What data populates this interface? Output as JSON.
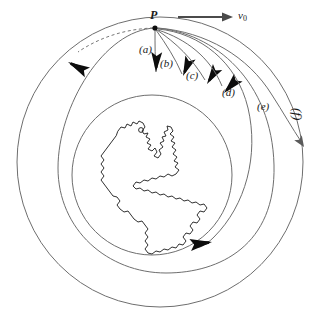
{
  "figure": {
    "background_color": "#ffffff",
    "stroke_color": "#555555",
    "dark_stroke_color": "#111111",
    "earth_stroke_color": "#6b6b6b",
    "continent_stroke_color": "#1a1a1a"
  },
  "launch_point": {
    "label": "P",
    "x": 155,
    "y": 28,
    "dot_radius": 2.6
  },
  "velocity_vector": {
    "label_v": "v",
    "label_sub": "0",
    "label_full": "v0",
    "arrow_from_x": 178,
    "arrow_to_x": 232,
    "arrow_y": 17,
    "label_x": 238,
    "label_y": 11
  },
  "trajectories": [
    {
      "id": "a",
      "label": "(a)",
      "label_x": 141,
      "label_y": 45,
      "impact_description": "steep near-vertical fall just past launch point",
      "arrowhead_angle_deg": 95
    },
    {
      "id": "b",
      "label": "(b)",
      "label_x": 160,
      "label_y": 58,
      "impact_description": "falls to surface a short distance downrange",
      "arrowhead_angle_deg": 110
    },
    {
      "id": "c",
      "label": "(c)",
      "label_x": 185,
      "label_y": 70,
      "impact_description": "falls to surface farther downrange",
      "arrowhead_angle_deg": 125
    },
    {
      "id": "d",
      "label": "(d)",
      "label_x": 223,
      "label_y": 88,
      "impact_description": "grazes further around the globe before impact",
      "arrowhead_angle_deg": 140
    },
    {
      "id": "e",
      "label": "(e)",
      "label_x": 258,
      "label_y": 103,
      "impact_description": "closed elliptical orbit returning to P",
      "arrowhead_angle_deg": null
    },
    {
      "id": "f",
      "label": "(f)",
      "label_x": 299,
      "label_y": 109,
      "impact_description": "escape trajectory leaving Earth",
      "arrowhead_angle_deg": null
    }
  ],
  "orbit_direction_markers": [
    {
      "name": "outer-orbit-retrograde-arrowhead",
      "x": 75,
      "y": 57,
      "angle_deg": 205
    },
    {
      "name": "inner-orbit-forward-arrowhead",
      "x": 196,
      "y": 245,
      "angle_deg": 355
    }
  ],
  "circles": {
    "earth": {
      "cx": 152,
      "cy": 175,
      "r": 80,
      "name": "earth-globe"
    },
    "middle_orbit": {
      "cx": 166,
      "cy": 168,
      "rx": 108,
      "ry": 105,
      "name": "middle-orbit-circle"
    },
    "outer_orbit": {
      "cx": 160,
      "cy": 162,
      "rx": 143,
      "ry": 145,
      "name": "outer-orbit-circle"
    }
  },
  "continent": {
    "name": "americas-landmass",
    "description": "Outline of North and South America centered on the globe"
  }
}
